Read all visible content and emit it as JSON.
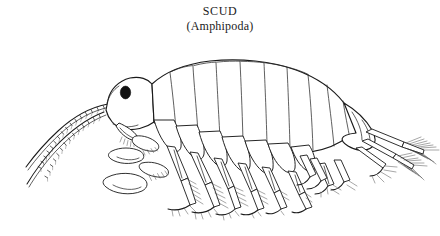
{
  "page": {
    "background_color": "#ffffff",
    "ink_color": "#1a1a1a",
    "width": 440,
    "height": 236
  },
  "caption": {
    "common_name": "SCUD",
    "scientific_group": "(Amphipoda)"
  },
  "figure": {
    "style": "pen-and-ink scientific line drawing",
    "orientation": "lateral view, head at left, tail at right",
    "parts": [
      {
        "name": "head",
        "label": "head"
      },
      {
        "name": "eye",
        "label": "compound eye",
        "color": "#111111"
      },
      {
        "name": "antenna-1",
        "label": "first antenna"
      },
      {
        "name": "antenna-2",
        "label": "second antenna"
      },
      {
        "name": "gnathopod-1",
        "label": "first gnathopod"
      },
      {
        "name": "gnathopod-2",
        "label": "second gnathopod"
      },
      {
        "name": "pereon",
        "label": "pereon segments"
      },
      {
        "name": "coxal-plates",
        "label": "coxal plates"
      },
      {
        "name": "pereopods",
        "label": "walking legs with setae"
      },
      {
        "name": "pleon",
        "label": "pleon"
      },
      {
        "name": "urosome",
        "label": "urosome"
      },
      {
        "name": "uropods",
        "label": "uropods with plumose setae"
      },
      {
        "name": "telson",
        "label": "telson"
      }
    ]
  }
}
